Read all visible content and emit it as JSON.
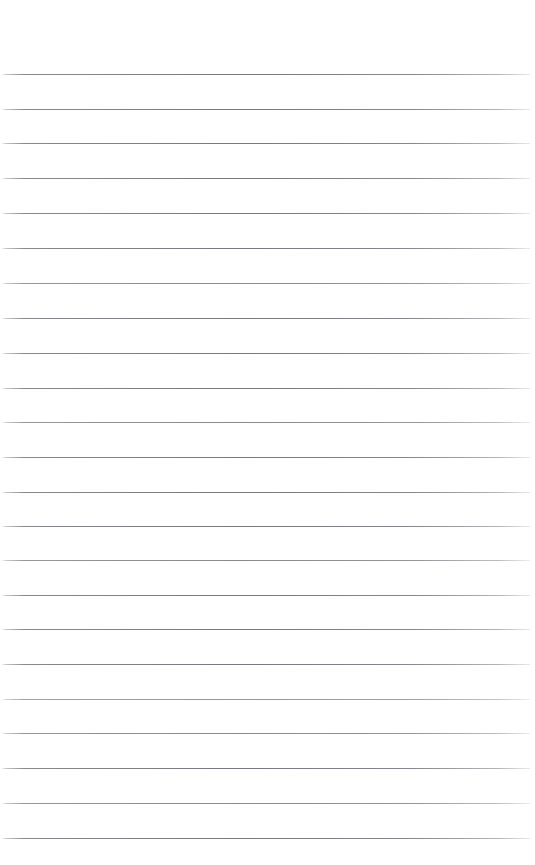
{
  "document": {
    "kind": "blank-ruled-notebook-page",
    "title": "Blank Ruled Paper",
    "page_width": 535,
    "page_height": 865,
    "background_color": "#ffffff",
    "text_content": "",
    "visible_text_blocks": []
  },
  "ruling": {
    "line_color": "#7d7d84",
    "line_color_faded": "#b9b9c0",
    "line_thickness_px": 1,
    "line_count": 23,
    "first_line_y": 74,
    "last_line_y": 838,
    "line_spacing_px": 34.7,
    "line_start_x": 2,
    "line_end_x": 530,
    "top_margin_px": 74,
    "bottom_margin_px": 27,
    "left_margin_px": 2,
    "right_margin_px": 5,
    "lines": [
      {
        "index": 1,
        "y": 74,
        "x1": 2,
        "x2": 530,
        "opacity": "full"
      },
      {
        "index": 2,
        "y": 109,
        "x1": 2,
        "x2": 530,
        "opacity": "full"
      },
      {
        "index": 3,
        "y": 143,
        "x1": 2,
        "x2": 530,
        "opacity": "full"
      },
      {
        "index": 4,
        "y": 178,
        "x1": 2,
        "x2": 530,
        "opacity": "full"
      },
      {
        "index": 5,
        "y": 213,
        "x1": 2,
        "x2": 530,
        "opacity": "full"
      },
      {
        "index": 6,
        "y": 248,
        "x1": 2,
        "x2": 530,
        "opacity": "full"
      },
      {
        "index": 7,
        "y": 283,
        "x1": 2,
        "x2": 530,
        "opacity": "soft"
      },
      {
        "index": 8,
        "y": 318,
        "x1": 2,
        "x2": 530,
        "opacity": "full"
      },
      {
        "index": 9,
        "y": 353,
        "x1": 2,
        "x2": 530,
        "opacity": "full"
      },
      {
        "index": 10,
        "y": 388,
        "x1": 2,
        "x2": 530,
        "opacity": "full"
      },
      {
        "index": 11,
        "y": 422,
        "x1": 2,
        "x2": 530,
        "opacity": "soft"
      },
      {
        "index": 12,
        "y": 457,
        "x1": 2,
        "x2": 530,
        "opacity": "full"
      },
      {
        "index": 13,
        "y": 492,
        "x1": 2,
        "x2": 530,
        "opacity": "full"
      },
      {
        "index": 14,
        "y": 526,
        "x1": 2,
        "x2": 530,
        "opacity": "full"
      },
      {
        "index": 15,
        "y": 560,
        "x1": 2,
        "x2": 530,
        "opacity": "soft"
      },
      {
        "index": 16,
        "y": 595,
        "x1": 2,
        "x2": 530,
        "opacity": "full"
      },
      {
        "index": 17,
        "y": 629,
        "x1": 2,
        "x2": 530,
        "opacity": "full"
      },
      {
        "index": 18,
        "y": 664,
        "x1": 2,
        "x2": 530,
        "opacity": "full"
      },
      {
        "index": 19,
        "y": 699,
        "x1": 2,
        "x2": 530,
        "opacity": "softer"
      },
      {
        "index": 20,
        "y": 733,
        "x1": 2,
        "x2": 530,
        "opacity": "soft"
      },
      {
        "index": 21,
        "y": 768,
        "x1": 2,
        "x2": 530,
        "opacity": "full"
      },
      {
        "index": 22,
        "y": 803,
        "x1": 2,
        "x2": 530,
        "opacity": "soft"
      },
      {
        "index": 23,
        "y": 838,
        "x1": 2,
        "x2": 530,
        "opacity": "full"
      }
    ]
  }
}
